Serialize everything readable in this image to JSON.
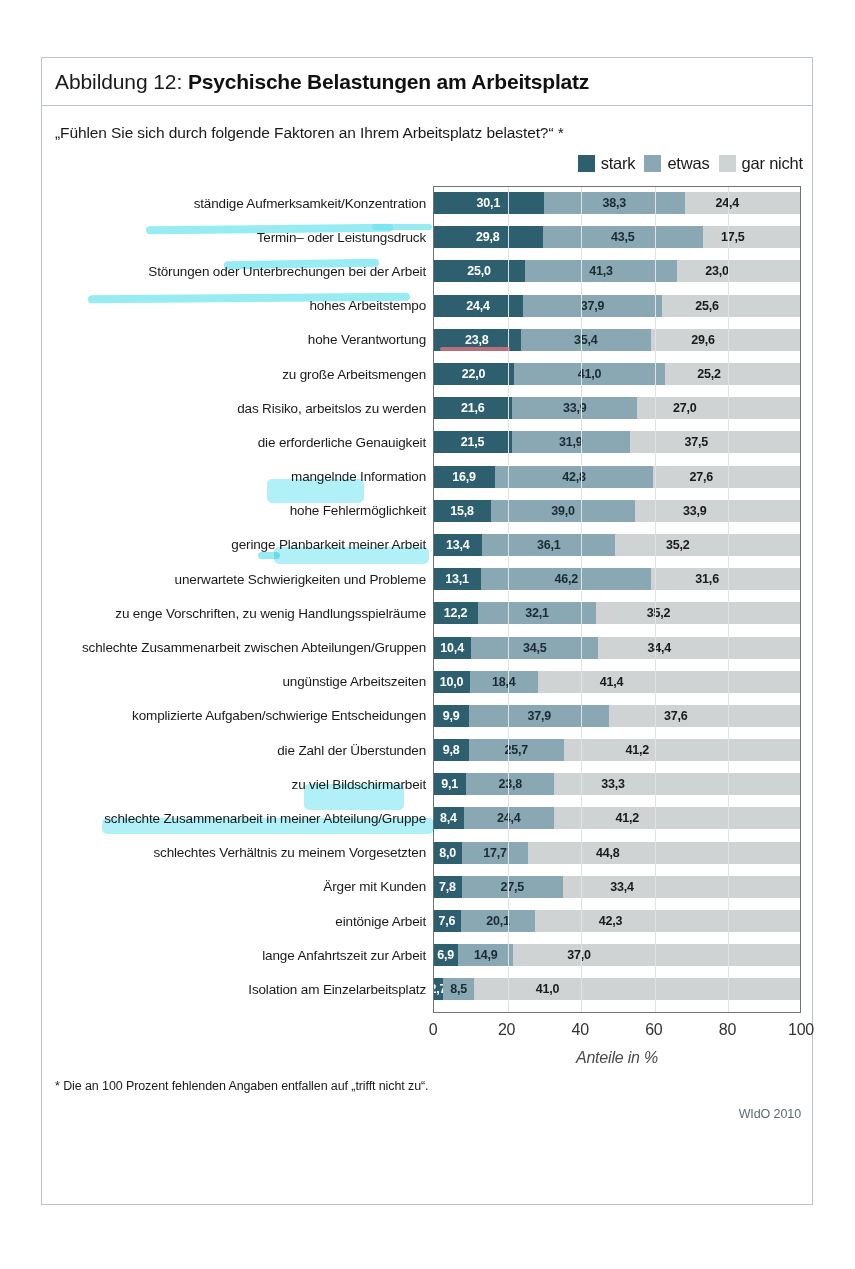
{
  "figure": {
    "number_label": "Abbildung 12: ",
    "title": "Psychische Belastungen am Arbeitsplatz",
    "question": "„Fühlen Sie sich durch folgende Faktoren an Ihrem Arbeitsplatz belastet?“ *",
    "footnote": "* Die an 100 Prozent fehlenden Angaben entfallen auf „trifft nicht zu“.",
    "source": "WIdO 2010"
  },
  "legend": {
    "items": [
      {
        "label": "stark",
        "color": "#2d5f6e"
      },
      {
        "label": "etwas",
        "color": "#8aa7b4"
      },
      {
        "label": "gar nicht",
        "color": "#cfd3d4"
      }
    ]
  },
  "colors": {
    "strong": "#2d5f6e",
    "some": "#8aa7b4",
    "none": "#cfd3d4",
    "frame": "#b9c4cc",
    "highlighter": "#6fe3ef"
  },
  "chart_data": {
    "type": "bar",
    "subtype": "stacked-horizontal",
    "title": "Psychische Belastungen am Arbeitsplatz",
    "subtitle": "„Fühlen Sie sich durch folgende Faktoren an Ihrem Arbeitsplatz belastet?“ *",
    "xlabel": "Anteile in %",
    "ylabel": "",
    "xlim": [
      0,
      100
    ],
    "xticks": [
      "0",
      "20",
      "40",
      "60",
      "80",
      "100"
    ],
    "grid": true,
    "legend_position": "top-right",
    "series": [
      {
        "name": "stark",
        "color": "#2d5f6e"
      },
      {
        "name": "etwas",
        "color": "#8aa7b4"
      },
      {
        "name": "gar nicht",
        "color": "#cfd3d4"
      }
    ],
    "categories": [
      "ständige Aufmerksamkeit/Konzentration",
      "Termin– oder Leistungsdruck",
      "Störungen oder Unterbrechungen bei der Arbeit",
      "hohes Arbeitstempo",
      "hohe Verantwortung",
      "zu große Arbeitsmengen",
      "das Risiko, arbeitslos zu werden",
      "die erforderliche Genauigkeit",
      "mangelnde Information",
      "hohe Fehlermöglichkeit",
      "geringe Planbarkeit meiner Arbeit",
      "unerwartete Schwierigkeiten und Probleme",
      "zu enge Vorschriften, zu wenig Handlungsspielräume",
      "schlechte Zusammenarbeit zwischen Abteilungen/Gruppen",
      "ungünstige Arbeitszeiten",
      "komplizierte Aufgaben/schwierige Entscheidungen",
      "die Zahl der Überstunden",
      "zu viel Bildschirmarbeit",
      "schlechte Zusammenarbeit in meiner Abteilung/Gruppe",
      "schlechtes Verhältnis zu meinem Vorgesetzten",
      "Ärger mit Kunden",
      "eintönige Arbeit",
      "lange Anfahrtszeit zur Arbeit",
      "Isolation am Einzelarbeitsplatz"
    ],
    "values": {
      "stark": [
        30.1,
        29.8,
        25.0,
        24.4,
        23.8,
        22.0,
        21.6,
        21.5,
        16.9,
        15.8,
        13.4,
        13.1,
        12.2,
        10.4,
        10.0,
        9.9,
        9.8,
        9.1,
        8.4,
        8.0,
        7.8,
        7.6,
        6.9,
        2.7
      ],
      "etwas": [
        38.3,
        43.5,
        41.3,
        37.9,
        35.4,
        41.0,
        33.9,
        31.9,
        42.8,
        39.0,
        36.1,
        46.2,
        32.1,
        34.5,
        18.4,
        37.9,
        25.7,
        23.8,
        24.4,
        17.7,
        27.5,
        20.1,
        14.9,
        8.5
      ],
      "gar nicht": [
        24.4,
        17.5,
        23.0,
        25.6,
        29.6,
        25.2,
        27.0,
        37.5,
        27.6,
        33.9,
        35.2,
        31.6,
        35.2,
        34.4,
        41.4,
        37.6,
        41.2,
        33.3,
        41.2,
        44.8,
        33.4,
        42.3,
        37.0,
        41.0
      ]
    },
    "value_labels": {
      "stark": [
        "30,1",
        "29,8",
        "25,0",
        "24,4",
        "23,8",
        "22,0",
        "21,6",
        "21,5",
        "16,9",
        "15,8",
        "13,4",
        "13,1",
        "12,2",
        "10,4",
        "10,0",
        "9,9",
        "9,8",
        "9,1",
        "8,4",
        "8,0",
        "7,8",
        "7,6",
        "6,9",
        "2,7"
      ],
      "etwas": [
        "38,3",
        "43,5",
        "41,3",
        "37,9",
        "35,4",
        "41,0",
        "33,9",
        "31,9",
        "42,8",
        "39,0",
        "36,1",
        "46,2",
        "32,1",
        "34,5",
        "18,4",
        "37,9",
        "25,7",
        "23,8",
        "24,4",
        "17,7",
        "27,5",
        "20,1",
        "14,9",
        "8,5"
      ],
      "gar nicht": [
        "24,4",
        "17,5",
        "23,0",
        "25,6",
        "29,6",
        "25,2",
        "27,0",
        "37,5",
        "27,6",
        "33,9",
        "35,2",
        "31,6",
        "35,2",
        "34,4",
        "41,4",
        "37,6",
        "41,2",
        "33,3",
        "41,2",
        "44,8",
        "33,4",
        "42,3",
        "37,0",
        "41,0"
      ]
    }
  }
}
